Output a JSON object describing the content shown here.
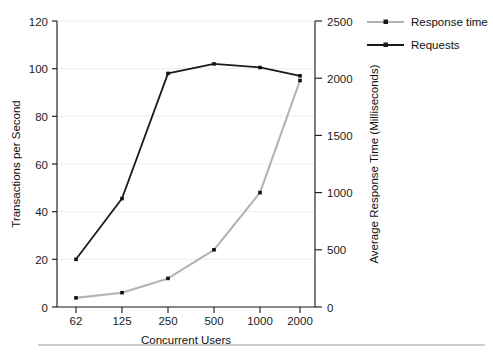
{
  "chart_data": {
    "type": "line",
    "title": "",
    "xlabel": "Concurrent Users",
    "ylabel": "Transactions per Second",
    "y2label": "Average Response Time (Milliseconds)",
    "categories": [
      "62",
      "125",
      "250",
      "500",
      "1000",
      "2000"
    ],
    "grid": true,
    "legend_position": "top-right",
    "ylim": [
      0,
      120
    ],
    "y2lim": [
      0,
      2500
    ],
    "yticks": [
      "0",
      "20",
      "40",
      "60",
      "80",
      "100",
      "120"
    ],
    "ytick_values": [
      0,
      20,
      40,
      60,
      80,
      100,
      120
    ],
    "y2ticks": [
      "0",
      "500",
      "1000",
      "1500",
      "2000",
      "2500"
    ],
    "y2tick_values": [
      0,
      500,
      1000,
      1500,
      2000,
      2500
    ],
    "series": [
      {
        "name": "Requests",
        "axis": "left",
        "color": "#1a1a1a",
        "marker": "square",
        "values": [
          20,
          45.5,
          98,
          102,
          100.5,
          97
        ]
      },
      {
        "name": "Response time",
        "axis": "right",
        "color": "#b3b3b3",
        "marker": "square",
        "values": [
          80,
          125,
          250,
          500,
          1000,
          1980
        ]
      }
    ]
  },
  "legend": {
    "entries": [
      {
        "label": "Response time",
        "color": "#b3b3b3"
      },
      {
        "label": "Requests",
        "color": "#1a1a1a"
      }
    ]
  },
  "axes": {
    "left_title": "Transactions per Second",
    "right_title": "Average Response Time (Milliseconds)",
    "bottom_title": "Concurrent Users",
    "left_ticks": [
      "120",
      "100",
      "80",
      "60",
      "40",
      "20",
      "0"
    ],
    "right_ticks": [
      "2500",
      "2000",
      "1500",
      "1000",
      "500",
      "0"
    ],
    "bottom_ticks": [
      "62",
      "125",
      "250",
      "500",
      "1000",
      "2000"
    ]
  },
  "caption": {
    "text": ""
  }
}
